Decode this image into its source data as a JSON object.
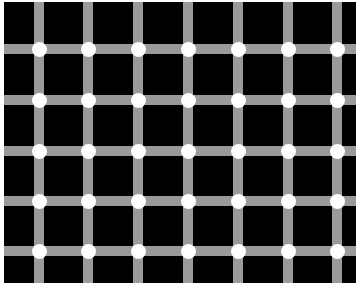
{
  "illusion": {
    "name": "scintillating grid",
    "background_color": "#000000",
    "line_color": "#9a9a9a",
    "dot_color": "#ffffff",
    "vertical_line_x": [
      34,
      83,
      133,
      183,
      233,
      283,
      332
    ],
    "horizontal_line_y": [
      44,
      95,
      146,
      196,
      246
    ],
    "line_width": 10,
    "dot_diameter": 15
  }
}
